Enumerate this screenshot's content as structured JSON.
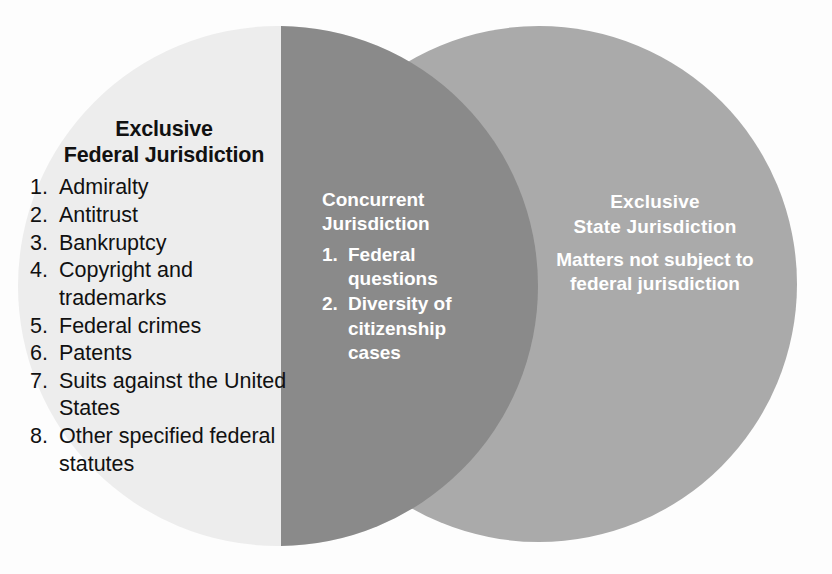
{
  "diagram": {
    "type": "venn",
    "background_color": "#fdfdfd",
    "regions": {
      "left": {
        "name": "exclusive-federal-jurisdiction",
        "fill_color": "#ededed",
        "text_color": "#111111",
        "title_line1": "Exclusive",
        "title_line2": "Federal Jurisdiction",
        "items": [
          {
            "num": "1.",
            "text": "Admiralty"
          },
          {
            "num": "2.",
            "text": "Antitrust"
          },
          {
            "num": "3.",
            "text": "Bankruptcy"
          },
          {
            "num": "4.",
            "text": "Copyright and trademarks"
          },
          {
            "num": "5.",
            "text": "Federal crimes"
          },
          {
            "num": "6.",
            "text": "Patents"
          },
          {
            "num": "7.",
            "text": "Suits against the United States"
          },
          {
            "num": "8.",
            "text": "Other specified federal statutes"
          }
        ]
      },
      "center": {
        "name": "concurrent-jurisdiction",
        "fill_color": "#8a8a8a",
        "text_color": "#ffffff",
        "title_line1": "Concurrent",
        "title_line2": "Jurisdiction",
        "items": [
          {
            "num": "1.",
            "text": "Federal questions"
          },
          {
            "num": "2.",
            "text": "Diversity of citizenship cases"
          }
        ]
      },
      "right": {
        "name": "exclusive-state-jurisdiction",
        "fill_color": "#aaaaaa",
        "text_color": "#ffffff",
        "title_line1": "Exclusive",
        "title_line2": "State Jurisdiction",
        "body_line1": "Matters not subject to",
        "body_line2": "federal jurisdiction"
      }
    }
  }
}
